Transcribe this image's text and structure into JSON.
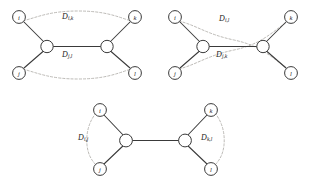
{
  "figure": {
    "background_color": "#ffffff",
    "edge_color": "#3a3a3a",
    "curve_color": "#b0aea9",
    "panels": [
      {
        "id": "panel-top-left",
        "leaves": {
          "top_left": "i",
          "bottom_left": "j",
          "top_right": "k",
          "bottom_right": "l"
        },
        "labels": {
          "upper": {
            "symbol": "D",
            "subscript": "i,k",
            "text": "D i,k"
          },
          "lower": {
            "symbol": "D",
            "subscript": "j,l",
            "text": "D j,l"
          }
        },
        "curve_pairs": [
          "i-k",
          "j-l"
        ],
        "curves_cross": false
      },
      {
        "id": "panel-top-right",
        "leaves": {
          "top_left": "i",
          "bottom_left": "j",
          "top_right": "k",
          "bottom_right": "l"
        },
        "labels": {
          "upper": {
            "symbol": "D",
            "subscript": "i,l",
            "text": "D i,l"
          },
          "lower": {
            "symbol": "D",
            "subscript": "j,k",
            "text": "D j,k"
          }
        },
        "curve_pairs": [
          "i-l",
          "j-k"
        ],
        "curves_cross": true
      },
      {
        "id": "panel-bottom-center",
        "leaves": {
          "top_left": "i",
          "bottom_left": "j",
          "top_right": "k",
          "bottom_right": "l"
        },
        "labels": {
          "left": {
            "symbol": "D",
            "subscript": "i,j",
            "text": "D i,j"
          },
          "right": {
            "symbol": "D",
            "subscript": "k,l",
            "text": "D k,l"
          }
        },
        "curve_pairs": [
          "i-j",
          "k-l"
        ],
        "curves_cross": false
      }
    ]
  }
}
